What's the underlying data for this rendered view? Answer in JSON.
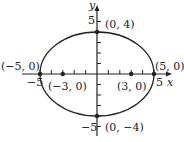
{
  "diagram": {
    "type": "ellipse",
    "equation_params": {
      "a": 5,
      "b": 4,
      "c": 3
    },
    "axes": {
      "x_label": "x",
      "y_label": "y"
    },
    "tick_labels": {
      "x_neg": "−5",
      "x_pos": "5",
      "y_pos": "5",
      "y_neg": "−5"
    },
    "points": [
      {
        "label": "(0, 4)",
        "x": 0,
        "y": 4
      },
      {
        "label": "(0, −4)",
        "x": 0,
        "y": -4
      },
      {
        "label": "(−5, 0)",
        "x": -5,
        "y": 0
      },
      {
        "label": "(5, 0)",
        "x": 5,
        "y": 0
      },
      {
        "label": "(−3, 0)",
        "x": -3,
        "y": 0
      },
      {
        "label": "(3, 0)",
        "x": 3,
        "y": 0
      }
    ],
    "colors": {
      "stroke": "#222222",
      "background": "#ffffff"
    }
  }
}
